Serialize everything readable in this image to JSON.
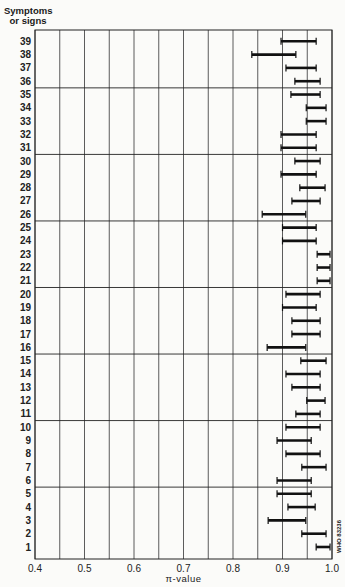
{
  "chart_data": {
    "type": "errorbar-range",
    "title": "",
    "ylabel": "Symptoms or signs",
    "xlabel": "π-value",
    "xlim": [
      0.4,
      1.0
    ],
    "xticks": [
      0.4,
      0.5,
      0.6,
      0.7,
      0.8,
      0.9,
      1.0
    ],
    "x_gridlines_step": 0.05,
    "y_separators_after": [
      5,
      10,
      15,
      20,
      25,
      30,
      35
    ],
    "categories": [
      "1",
      "2",
      "3",
      "4",
      "5",
      "6",
      "7",
      "8",
      "9",
      "10",
      "11",
      "12",
      "13",
      "14",
      "15",
      "16",
      "17",
      "18",
      "19",
      "20",
      "21",
      "22",
      "23",
      "24",
      "25",
      "26",
      "27",
      "28",
      "29",
      "30",
      "31",
      "32",
      "33",
      "34",
      "35",
      "36",
      "37",
      "38",
      "39"
    ],
    "series": [
      {
        "name": "lower",
        "values": [
          0.968,
          0.939,
          0.871,
          0.911,
          0.889,
          0.889,
          0.939,
          0.907,
          0.889,
          0.907,
          0.927,
          0.949,
          0.919,
          0.907,
          0.937,
          0.869,
          0.919,
          0.919,
          0.9,
          0.907,
          0.97,
          0.97,
          0.97,
          0.9,
          0.9,
          0.859,
          0.919,
          0.935,
          0.897,
          0.925,
          0.897,
          0.897,
          0.948,
          0.948,
          0.917,
          0.925,
          0.907,
          0.838,
          0.897
        ]
      },
      {
        "name": "upper",
        "values": [
          0.996,
          0.988,
          0.947,
          0.966,
          0.958,
          0.958,
          0.988,
          0.976,
          0.958,
          0.976,
          0.976,
          0.986,
          0.976,
          0.976,
          0.988,
          0.947,
          0.976,
          0.976,
          0.968,
          0.976,
          0.996,
          0.996,
          0.996,
          0.968,
          0.968,
          0.947,
          0.976,
          0.986,
          0.968,
          0.976,
          0.968,
          0.968,
          0.988,
          0.988,
          0.976,
          0.976,
          0.968,
          0.927,
          0.968
        ]
      }
    ],
    "grid": true,
    "legend": "none",
    "annotation": "WHO 83236"
  },
  "labels": {
    "ylabel_line1": "Symptoms",
    "ylabel_line2": "or signs",
    "xlabel": "π-value",
    "watermark": "WHO 83236"
  }
}
